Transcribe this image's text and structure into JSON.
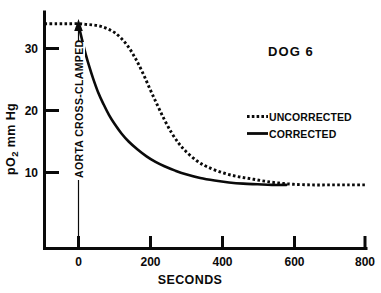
{
  "chart_data": {
    "type": "line",
    "title": "DOG 6",
    "xlabel": "SECONDS",
    "ylabel": "pO2 mm Hg",
    "ylabel_display": "pO₂ mm Hg",
    "xlim": [
      -95,
      800
    ],
    "ylim": [
      0,
      36
    ],
    "xticks": [
      0,
      200,
      400,
      600,
      800
    ],
    "xticklabels": [
      "0",
      "200",
      "400",
      "600",
      "800"
    ],
    "yticks": [
      10,
      20,
      30
    ],
    "yticklabels": [
      "10",
      "20",
      "30"
    ],
    "grid": false,
    "legend_position": "upper right",
    "series": [
      {
        "name": "UNCORRECTED",
        "style": "dotted",
        "color": "#0a0a0a",
        "x": [
          -95,
          -60,
          -30,
          0,
          20,
          40,
          60,
          80,
          100,
          120,
          140,
          160,
          180,
          200,
          220,
          240,
          260,
          280,
          300,
          330,
          360,
          400,
          440,
          480,
          520,
          560,
          600,
          650,
          700,
          750,
          800
        ],
        "y": [
          34.0,
          34.0,
          34.0,
          34.0,
          33.9,
          33.8,
          33.6,
          33.2,
          32.6,
          31.6,
          30.2,
          28.3,
          26.0,
          23.4,
          20.9,
          18.5,
          16.4,
          14.7,
          13.4,
          11.9,
          10.9,
          10.0,
          9.4,
          9.0,
          8.6,
          8.3,
          8.1,
          8.0,
          8.0,
          8.0,
          8.0
        ]
      },
      {
        "name": "CORRECTED",
        "style": "solid",
        "color": "#0a0a0a",
        "x": [
          0,
          10,
          20,
          30,
          40,
          55,
          70,
          85,
          100,
          120,
          140,
          165,
          190,
          215,
          240,
          270,
          300,
          340,
          380,
          420,
          460,
          500,
          540,
          580
        ],
        "y": [
          33.8,
          31.4,
          29.1,
          27.1,
          25.3,
          22.9,
          21.0,
          19.3,
          17.9,
          16.3,
          15.0,
          13.7,
          12.6,
          11.7,
          11.0,
          10.3,
          9.7,
          9.1,
          8.7,
          8.4,
          8.2,
          8.1,
          8.0,
          8.0
        ]
      }
    ],
    "annotations": [
      {
        "name": "aorta-cross-clamped",
        "text": "AORTA CROSS-CLAMPED",
        "x": 0,
        "arrow_from_y": 0,
        "arrow_to_y": 34,
        "orientation": "vertical"
      }
    ]
  }
}
